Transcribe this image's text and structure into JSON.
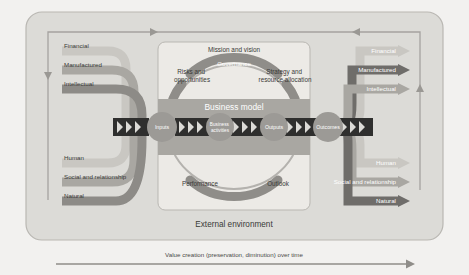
{
  "diagram": {
    "external_environment_label": "External environment",
    "business_model_label": "Business model",
    "mission_label": "Mission and vision",
    "governance_label": "Governance",
    "risks_label_line1": "Risks and",
    "risks_label_line2": "opportunities",
    "strategy_label_line1": "Strategy and",
    "strategy_label_line2": "resource allocation",
    "performance_label": "Performance",
    "outlook_label": "Outlook",
    "chain": [
      {
        "id": "inputs",
        "label": "Inputs"
      },
      {
        "id": "business-activities",
        "label_line1": "Business",
        "label_line2": "activities"
      },
      {
        "id": "outputs",
        "label": "Outputs"
      },
      {
        "id": "outcomes",
        "label": "Outcomes"
      }
    ],
    "capitals_in": [
      {
        "id": "financial",
        "label": "Financial"
      },
      {
        "id": "manufactured",
        "label": "Manufactured"
      },
      {
        "id": "intellectual",
        "label": "Intellectual"
      },
      {
        "id": "human",
        "label": "Human"
      },
      {
        "id": "social-and-relationship",
        "label": "Social and relationship"
      },
      {
        "id": "natural",
        "label": "Natural"
      }
    ],
    "capitals_out": [
      {
        "id": "financial",
        "label": "Financial"
      },
      {
        "id": "manufactured",
        "label": "Manufactured"
      },
      {
        "id": "intellectual",
        "label": "Intellectual"
      },
      {
        "id": "human",
        "label": "Human"
      },
      {
        "id": "social-and-relationship",
        "label": "Social and relationship"
      },
      {
        "id": "natural",
        "label": "Natural"
      }
    ],
    "footer_caption": "Value creation (preservation, diminution) over time",
    "colors": {
      "page_background": "#f2f1ef",
      "outer_panel": "#dcdbd7",
      "inner_panel": "#eceae6",
      "band_light": "#c9c7c2",
      "band_mid": "#a9a7a2",
      "band_dark": "#8d8b87",
      "band_darker": "#6f6d6a",
      "chain_dark": "#333333",
      "text_dark": "#3a3a38",
      "text_light": "#ffffff",
      "arc_gray": "#8f8d89",
      "ring_gray": "#9c9a96"
    }
  }
}
